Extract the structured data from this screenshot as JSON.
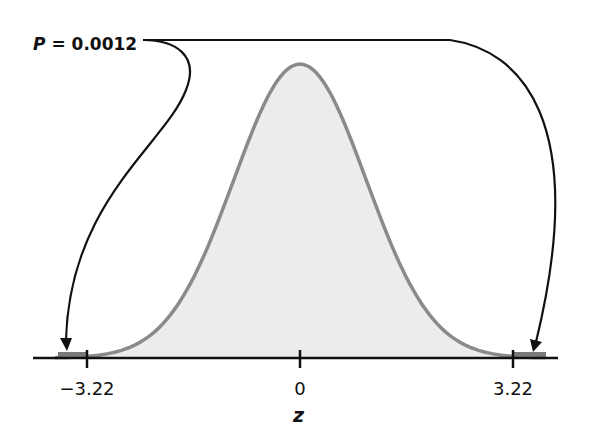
{
  "annotation": {
    "symbol": "P",
    "equals": " = ",
    "value": "0.0012"
  },
  "chart_data": {
    "type": "area",
    "title": "",
    "distribution": "standard normal",
    "xlabel": "z",
    "ylabel": "",
    "xlim": [
      -4,
      4
    ],
    "ticks": [
      {
        "value": -3.22,
        "label": "−3.22"
      },
      {
        "value": 0,
        "label": "0"
      },
      {
        "value": 3.22,
        "label": "3.22"
      }
    ],
    "shaded_tails": [
      {
        "from": -4,
        "to": -3.22
      },
      {
        "from": 3.22,
        "to": 4
      }
    ],
    "annotation_text": "P = 0.0012",
    "annotation_points_to": [
      "left-tail",
      "right-tail"
    ],
    "grid": false,
    "legend": "none"
  },
  "colors": {
    "curve_fill": "#ececec",
    "curve_stroke": "#8a8a8a",
    "tail_fill": "#7a7a7a",
    "axis": "#111111",
    "arrow": "#111111"
  }
}
